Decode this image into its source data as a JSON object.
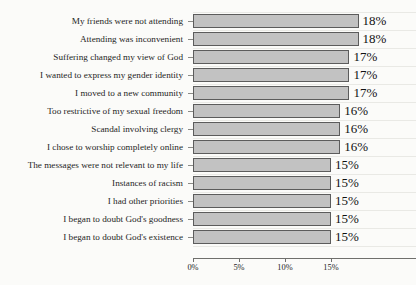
{
  "chart_data": {
    "type": "bar",
    "orientation": "horizontal",
    "title": "",
    "subtitle": "",
    "xlabel": "",
    "ylabel": "",
    "xlim": [
      0,
      17.5
    ],
    "grid": true,
    "legend": null,
    "value_suffix": "%",
    "xticks": [
      {
        "value": 0,
        "label": "0%"
      },
      {
        "value": 5,
        "label": "5%"
      },
      {
        "value": 10,
        "label": "10%"
      },
      {
        "value": 15,
        "label": "15%"
      }
    ],
    "categories": [
      "My friends were not attending",
      "Attending was inconvenient",
      "Suffering changed my view of God",
      "I wanted to express my gender identity",
      "I moved to a new community",
      "Too restrictive of my sexual freedom",
      "Scandal involving clergy",
      "I chose to worship completely online",
      "The messages were not relevant to my life",
      "Instances of racism",
      "I had other priorities",
      "I began to doubt God's goodness",
      "I began to doubt God's existence"
    ],
    "values": [
      18,
      18,
      17,
      17,
      17,
      16,
      16,
      16,
      15,
      15,
      15,
      15,
      15
    ],
    "data_labels": [
      "18%",
      "18%",
      "17%",
      "17%",
      "17%",
      "16%",
      "16%",
      "16%",
      "15%",
      "15%",
      "15%",
      "15%",
      "15%"
    ],
    "colors": {
      "bar_fill": "#c2c2c2",
      "bar_border": "#5c5c5c",
      "background": "#fbfbf9",
      "gridline": "#e9e9e5",
      "axis": "#6f6f6c",
      "text": "#1d1d1d"
    }
  }
}
